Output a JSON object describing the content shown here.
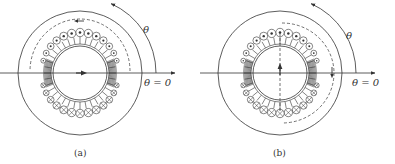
{
  "figures": [
    {
      "id": "a",
      "caption": "(a)",
      "angle_label": "θ",
      "zero_label": "θ = 0",
      "description": "Distributed winding with dot (out-of-page) conductors on top half and cross (into-page) conductors on bottom half; horizontal magnetic axis arrow; dashed flux path looping around top"
    },
    {
      "id": "b",
      "caption": "(b)",
      "angle_label": "θ",
      "zero_label": "θ = 0",
      "description": "Same winding with vertical dashed axis and upward arrow; dashed flux path on right side with downward arrow"
    }
  ],
  "colors": {
    "line": "#333333",
    "background": "#ffffff"
  }
}
